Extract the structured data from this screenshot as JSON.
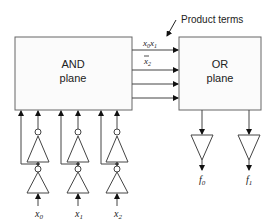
{
  "diagram": {
    "type": "PLA block diagram",
    "annotation": "Product terms",
    "and_plane": {
      "line1": "AND",
      "line2": "plane"
    },
    "or_plane": {
      "line1": "OR",
      "line2": "plane"
    },
    "product_terms": [
      {
        "var1": "x",
        "sub1": "0",
        "var2": "x",
        "sub2": "1"
      },
      {
        "var1": "x",
        "sub1": "2",
        "complement": true
      }
    ],
    "inputs": [
      {
        "var": "x",
        "sub": "0"
      },
      {
        "var": "x",
        "sub": "1"
      },
      {
        "var": "x",
        "sub": "2"
      }
    ],
    "outputs": [
      {
        "var": "f",
        "sub": "0"
      },
      {
        "var": "f",
        "sub": "1"
      }
    ],
    "colors": {
      "stroke": "#555555",
      "box_fill": "#fbfbfb",
      "text": "#222222"
    }
  }
}
